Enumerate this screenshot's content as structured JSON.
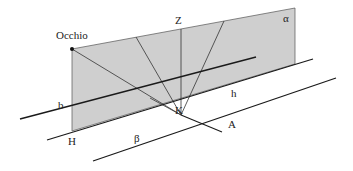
{
  "diagram": {
    "labels": {
      "eye": "Occhio",
      "zenith": "Z",
      "plane_alpha": "α",
      "line_b": "b",
      "point_h": "H",
      "point_k": "K",
      "line_h": "h",
      "plane_beta": "β",
      "point_a": "A"
    },
    "colors": {
      "plane_fill": "#cfcfcf",
      "line": "#1a1a1a",
      "background": "#ffffff"
    }
  }
}
